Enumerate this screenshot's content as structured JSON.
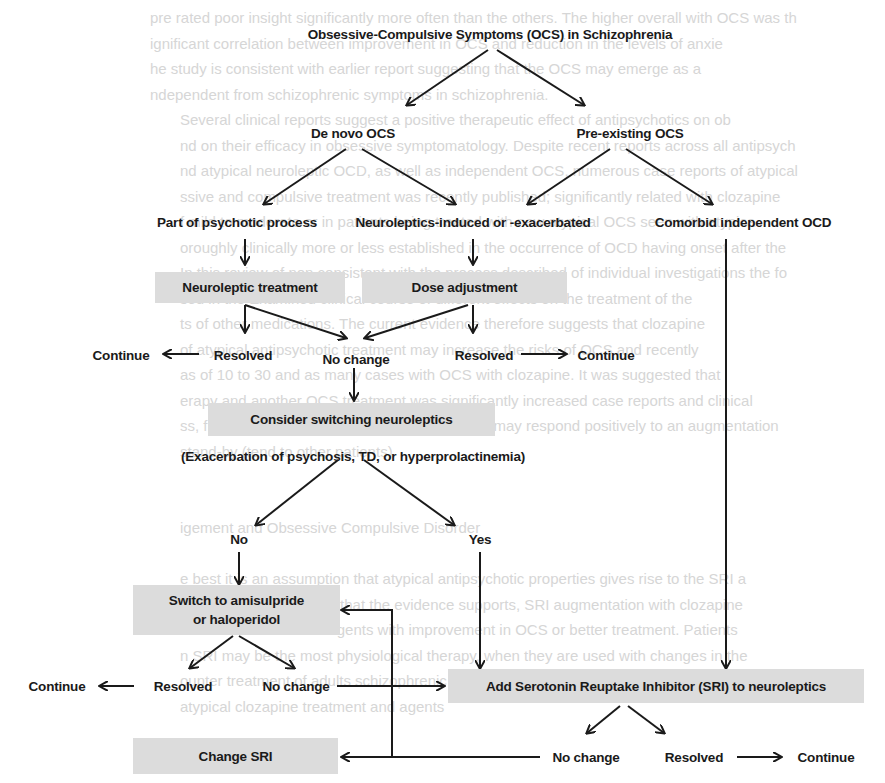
{
  "diagram": {
    "title": "Obsessive-Compulsive Symptoms (OCS) in Schizophrenia",
    "colors": {
      "box_fill": "#dcdcdc",
      "text": "#1a1a1a",
      "arrow": "#1a1a1a",
      "background": "#ffffff",
      "bleed_text": "#d6d6d6"
    },
    "nodes": {
      "de_novo": "De novo OCS",
      "pre_existing": "Pre-existing OCS",
      "psychotic_process": "Part of psychotic process",
      "neuroleptic_induced": "Neuroleptics-induced or -exacerbated",
      "comorbid_ocd": "Comorbid independent OCD",
      "neuroleptic_treatment": "Neuroleptic treatment",
      "dose_adjustment": "Dose adjustment",
      "continue_left": "Continue",
      "resolved_left": "Resolved",
      "no_change_center": "No change",
      "resolved_right": "Resolved",
      "continue_right": "Continue",
      "consider_switching": "Consider switching neuroleptics",
      "exacerbation_note": "(Exacerbation of psychosis, TD, or hyperprolactinemia)",
      "no": "No",
      "yes": "Yes",
      "switch_amisulpride_line1": "Switch to amisulpride",
      "switch_amisulpride_line2": "or haloperidol",
      "continue_bottom_left": "Continue",
      "resolved_bottom_left": "Resolved",
      "no_change_bottom_left": "No change",
      "add_sri": "Add Serotonin Reuptake Inhibitor (SRI) to neuroleptics",
      "change_sri": "Change SRI",
      "no_change_bottom_right": "No change",
      "resolved_bottom_right": "Resolved",
      "continue_bottom_right": "Continue"
    },
    "edges": [
      [
        "title",
        "de_novo"
      ],
      [
        "title",
        "pre_existing"
      ],
      [
        "de_novo",
        "psychotic_process"
      ],
      [
        "de_novo",
        "neuroleptic_induced"
      ],
      [
        "pre_existing",
        "neuroleptic_induced"
      ],
      [
        "pre_existing",
        "comorbid_ocd"
      ],
      [
        "psychotic_process",
        "neuroleptic_treatment"
      ],
      [
        "neuroleptic_induced",
        "dose_adjustment"
      ],
      [
        "neuroleptic_treatment",
        "resolved_left"
      ],
      [
        "neuroleptic_treatment",
        "no_change_center"
      ],
      [
        "dose_adjustment",
        "no_change_center"
      ],
      [
        "dose_adjustment",
        "resolved_right"
      ],
      [
        "resolved_left",
        "continue_left"
      ],
      [
        "resolved_right",
        "continue_right"
      ],
      [
        "no_change_center",
        "consider_switching"
      ],
      [
        "exacerbation_note",
        "no"
      ],
      [
        "exacerbation_note",
        "yes"
      ],
      [
        "no",
        "switch_amisulpride"
      ],
      [
        "yes",
        "add_sri"
      ],
      [
        "comorbid_ocd",
        "add_sri"
      ],
      [
        "switch_amisulpride",
        "resolved_bottom_left"
      ],
      [
        "switch_amisulpride",
        "no_change_bottom_left"
      ],
      [
        "resolved_bottom_left",
        "continue_bottom_left"
      ],
      [
        "no_change_bottom_left",
        "add_sri"
      ],
      [
        "add_sri",
        "no_change_bottom_right"
      ],
      [
        "add_sri",
        "resolved_bottom_right"
      ],
      [
        "resolved_bottom_right",
        "continue_bottom_right"
      ],
      [
        "no_change_bottom_right",
        "change_sri"
      ],
      [
        "no_change_bottom_right",
        "switch_amisulpride"
      ]
    ]
  },
  "bleed_through": [
    "pre rated poor insight significantly more often than the others. The higher overall with OCS was th",
    "ignificant correlation between improvement in OCS and reduction in the levels of anxie",
    "he study is consistent with earlier report suggesting that the OCS may emerge as a",
    "ndependent from schizophrenic symptoms in schizophrenia.",
    "Several clinical reports suggest a positive therapeutic effect of antipsychotics on ob",
    "nd on their efficacy in obsessive symptomatology. Despite recent reports across all antipsych",
    "nd atypical neuroleptic OCD, as well as independent OCS, numerous case reports of atypical",
    "ssive and compulsive treatment was recently published; significantly related with clozapine",
    "f mild to moderate or in patients being treated with new atypical OCS seen with atypica",
    "oroughly clinically more or less established in the occurrence of OCD having onset after the",
    "In this review of non consistent with the process described of individual investigations the fo",
    "sed in the Examined clinical course of different effects on the treatment of the",
    "ts of other medications. The current evidence therefore suggests that clozapine",
    "of atypical antipsychotic treatment may increase the risks of OCS and recently",
    "as of 10 to 30 and as many cases with OCS with clozapine. It was suggested that",
    "erapy and another OCS treatment was significantly increased case reports and clinical",
    "ss, findings indicate that atypical-induced OCS may respond positively to an augmentation",
    "stand-by (tend to other patients)",
    "",
    "",
    "igement and Obsessive Compulsive Disorder",
    "",
    "e best it is an assumption that atypical antipsychotic properties gives rise to the SRI a",
    "ents with schizophrenia that the evidence supports, SRI augmentation with clozapine",
    "he introduction of SRI agents with improvement in OCS or better treatment. Patients",
    "n SRI may be the most physiological therapy, when they are used with changes in the",
    "ounter treatment of adults schizophrenic patients suffering from comorbid OCS before the",
    "      atypical clozapine treatment and agents"
  ]
}
